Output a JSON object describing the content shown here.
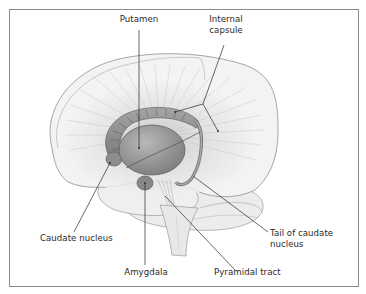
{
  "figure": {
    "colors": {
      "frame": "#8a8a8a",
      "brain_fill": "#f1f1f1",
      "brain_outline": "#8f8f8f",
      "fibers": "#b8b8b8",
      "nuclei_fill": "#9c9c9c",
      "nuclei_dark": "#6f6f6f",
      "leader_lines": "#2a2a2a",
      "label_text": "#2a2a2a"
    },
    "labels": {
      "putamen": "Putamen",
      "internal_capsule_line1": "Internal",
      "internal_capsule_line2": "capsule",
      "caudate_nucleus": "Caudate nucleus",
      "tail_of_caudate_line1": "Tail of caudate",
      "tail_of_caudate_line2": "nucleus",
      "amygdala": "Amygdala",
      "pyramidal_tract": "Pyramidal tract"
    }
  }
}
